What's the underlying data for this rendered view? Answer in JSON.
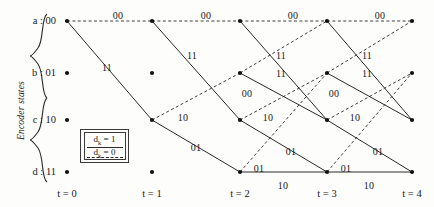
{
  "figure": {
    "kind": "trellis-diagram",
    "axis_label": "Encoder states",
    "states": [
      {
        "key": "a",
        "label": "a : 00",
        "y": 21
      },
      {
        "key": "b",
        "label": "b : 01",
        "y": 73
      },
      {
        "key": "c",
        "label": "c : 10",
        "y": 120
      },
      {
        "key": "d",
        "label": "d : 11",
        "y": 172
      }
    ],
    "times": [
      {
        "label": "t = 0",
        "x": 67
      },
      {
        "label": "t = 1",
        "x": 152
      },
      {
        "label": "t = 2",
        "x": 240
      },
      {
        "label": "t = 3",
        "x": 327
      },
      {
        "label": "t = 4",
        "x": 412
      }
    ]
  },
  "legend": {
    "solid_text": "d",
    "solid_sub": "k",
    "solid_value": " = 1",
    "dashed_text": "d",
    "dashed_sub": "k",
    "dashed_value": " = 0"
  },
  "chart_data": {
    "type": "diagram",
    "title": "",
    "xlabel": "",
    "ylabel": "Encoder states",
    "categories": [
      "t = 0",
      "t = 1",
      "t = 2",
      "t = 3",
      "t = 4"
    ],
    "state_order": [
      "a : 00",
      "b : 01",
      "c : 10",
      "d : 11"
    ],
    "node_dots": [
      {
        "t": 0,
        "state": "a"
      },
      {
        "t": 0,
        "state": "b"
      },
      {
        "t": 0,
        "state": "c"
      },
      {
        "t": 0,
        "state": "d"
      },
      {
        "t": 1,
        "state": "a"
      },
      {
        "t": 1,
        "state": "b"
      },
      {
        "t": 1,
        "state": "c"
      },
      {
        "t": 1,
        "state": "d"
      },
      {
        "t": 2,
        "state": "a"
      },
      {
        "t": 2,
        "state": "b"
      },
      {
        "t": 2,
        "state": "c"
      },
      {
        "t": 2,
        "state": "d"
      },
      {
        "t": 3,
        "state": "a"
      },
      {
        "t": 3,
        "state": "b"
      },
      {
        "t": 3,
        "state": "c"
      },
      {
        "t": 3,
        "state": "d"
      },
      {
        "t": 4,
        "state": "a"
      },
      {
        "t": 4,
        "state": "b"
      },
      {
        "t": 4,
        "state": "c"
      },
      {
        "t": 4,
        "state": "d"
      }
    ],
    "transition_rules": [
      {
        "from": "a",
        "to": "a",
        "input": 0,
        "output": "00",
        "style": "dashed"
      },
      {
        "from": "a",
        "to": "c",
        "input": 1,
        "output": "11",
        "style": "solid"
      },
      {
        "from": "b",
        "to": "a",
        "input": 0,
        "output": "11",
        "style": "dashed"
      },
      {
        "from": "b",
        "to": "c",
        "input": 1,
        "output": "00",
        "style": "solid"
      },
      {
        "from": "c",
        "to": "b",
        "input": 0,
        "output": "10",
        "style": "dashed"
      },
      {
        "from": "c",
        "to": "d",
        "input": 1,
        "output": "01",
        "style": "solid"
      },
      {
        "from": "d",
        "to": "b",
        "input": 0,
        "output": "01",
        "style": "dashed"
      },
      {
        "from": "d",
        "to": "d",
        "input": 1,
        "output": "10",
        "style": "solid"
      }
    ],
    "edges": [
      {
        "t": 0,
        "from": "a",
        "to": "a",
        "output": "00",
        "style": "dashed"
      },
      {
        "t": 0,
        "from": "a",
        "to": "c",
        "output": "11",
        "style": "solid"
      },
      {
        "t": 1,
        "from": "a",
        "to": "a",
        "output": "00",
        "style": "dashed"
      },
      {
        "t": 1,
        "from": "a",
        "to": "c",
        "output": "11",
        "style": "solid"
      },
      {
        "t": 1,
        "from": "c",
        "to": "b",
        "output": "10",
        "style": "dashed"
      },
      {
        "t": 1,
        "from": "c",
        "to": "d",
        "output": "01",
        "style": "solid"
      },
      {
        "t": 2,
        "from": "a",
        "to": "a",
        "output": "00",
        "style": "dashed"
      },
      {
        "t": 2,
        "from": "a",
        "to": "c",
        "output": "11",
        "style": "solid"
      },
      {
        "t": 2,
        "from": "b",
        "to": "a",
        "output": "11",
        "style": "dashed"
      },
      {
        "t": 2,
        "from": "b",
        "to": "c",
        "output": "00",
        "style": "solid"
      },
      {
        "t": 2,
        "from": "c",
        "to": "b",
        "output": "10",
        "style": "dashed"
      },
      {
        "t": 2,
        "from": "c",
        "to": "d",
        "output": "01",
        "style": "solid"
      },
      {
        "t": 2,
        "from": "d",
        "to": "b",
        "output": "01",
        "style": "dashed"
      },
      {
        "t": 2,
        "from": "d",
        "to": "d",
        "output": "10",
        "style": "solid"
      },
      {
        "t": 3,
        "from": "a",
        "to": "a",
        "output": "00",
        "style": "dashed"
      },
      {
        "t": 3,
        "from": "a",
        "to": "c",
        "output": "11",
        "style": "solid"
      },
      {
        "t": 3,
        "from": "b",
        "to": "a",
        "output": "11",
        "style": "dashed"
      },
      {
        "t": 3,
        "from": "b",
        "to": "c",
        "output": "00",
        "style": "solid"
      },
      {
        "t": 3,
        "from": "c",
        "to": "b",
        "output": "10",
        "style": "dashed"
      },
      {
        "t": 3,
        "from": "c",
        "to": "d",
        "output": "01",
        "style": "solid"
      },
      {
        "t": 3,
        "from": "d",
        "to": "b",
        "output": "01",
        "style": "dashed"
      },
      {
        "t": 3,
        "from": "d",
        "to": "d",
        "output": "10",
        "style": "solid"
      }
    ],
    "edge_labels": [
      {
        "text": "00",
        "x": 118,
        "y": 10
      },
      {
        "text": "00",
        "x": 206,
        "y": 10
      },
      {
        "text": "00",
        "x": 293,
        "y": 10
      },
      {
        "text": "00",
        "x": 380,
        "y": 10
      },
      {
        "text": "11",
        "x": 107,
        "y": 62
      },
      {
        "text": "11",
        "x": 192,
        "y": 50
      },
      {
        "text": "11",
        "x": 281,
        "y": 50
      },
      {
        "text": "11",
        "x": 367,
        "y": 50
      },
      {
        "text": "11",
        "x": 281,
        "y": 68
      },
      {
        "text": "11",
        "x": 367,
        "y": 68
      },
      {
        "text": "00",
        "x": 247,
        "y": 88
      },
      {
        "text": "00",
        "x": 334,
        "y": 88
      },
      {
        "text": "10",
        "x": 183,
        "y": 112
      },
      {
        "text": "10",
        "x": 268,
        "y": 112
      },
      {
        "text": "10",
        "x": 355,
        "y": 112
      },
      {
        "text": "01",
        "x": 196,
        "y": 142
      },
      {
        "text": "01",
        "x": 291,
        "y": 146
      },
      {
        "text": "01",
        "x": 378,
        "y": 146
      },
      {
        "text": "01",
        "x": 259,
        "y": 163
      },
      {
        "text": "01",
        "x": 346,
        "y": 163
      },
      {
        "text": "10",
        "x": 283,
        "y": 180
      },
      {
        "text": "10",
        "x": 369,
        "y": 180
      }
    ],
    "grid": false,
    "legend_position": "inside-left"
  }
}
